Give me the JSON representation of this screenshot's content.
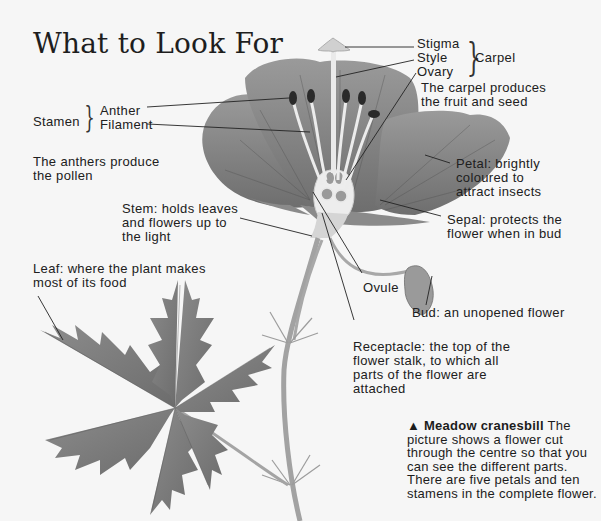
{
  "title": "What to Look For",
  "labels": {
    "stigma": "Stigma",
    "style": "Style",
    "ovary": "Ovary",
    "carpel": "Carpel",
    "carpel_note": [
      "The carpel produces",
      "the fruit and seed"
    ],
    "stamen": "Stamen",
    "anther": "Anther",
    "filament": "Filament",
    "anther_note": [
      "The anthers produce",
      "the pollen"
    ],
    "petal": [
      "Petal: brightly",
      "coloured to",
      "attract insects"
    ],
    "sepal": [
      "Sepal: protects the",
      "flower when in bud"
    ],
    "stem": [
      "Stem: holds leaves",
      "and flowers up to",
      "the light"
    ],
    "leaf": [
      "Leaf: where the plant makes",
      "most of its food"
    ],
    "ovule": "Ovule",
    "bud": "Bud: an unopened flower",
    "receptacle": [
      "Receptacle: the top of the",
      "flower stalk, to which all",
      "parts of the flower are",
      "attached"
    ]
  },
  "caption": {
    "marker": "▲",
    "heading": "Meadow cranesbill",
    "text": "The picture shows a flower cut through the centre so that you can see the different parts. There are five petals and ten stamens in the complete flower."
  },
  "colors": {
    "background": "#f6f6f6",
    "petal": "#8a8a8a",
    "petal_dark": "#6a6a6a",
    "leaf": "#7a7a7a",
    "stem": "#a8a8a8",
    "ink": "#1c1c1c"
  }
}
